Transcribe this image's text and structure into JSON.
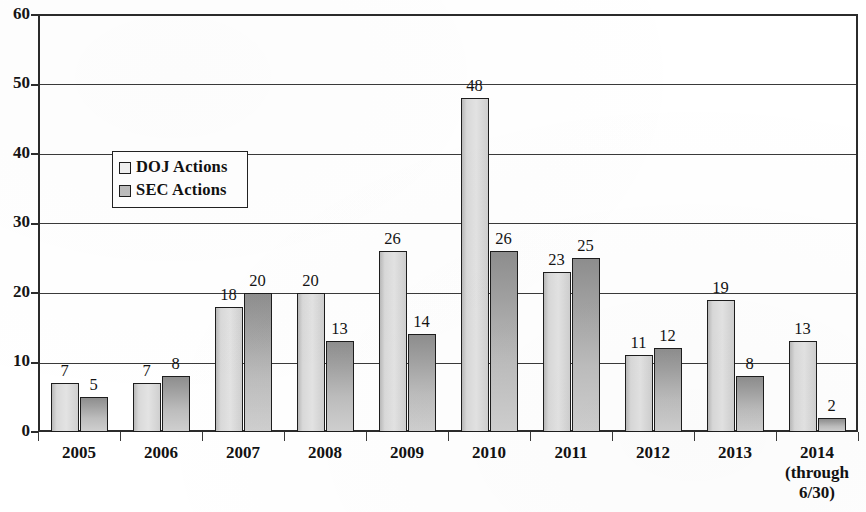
{
  "chart_data": {
    "type": "bar",
    "title": "",
    "subtitle": "",
    "xlabel": "",
    "ylabel": "",
    "ylim": [
      0,
      60
    ],
    "yticks": [
      0,
      10,
      20,
      30,
      40,
      50,
      60
    ],
    "ytick_labels": [
      "0",
      "10",
      "20",
      "30",
      "40",
      "50",
      "60"
    ],
    "grid": true,
    "grid_axis": "y",
    "legend_position": "upper-left-inside",
    "categories": [
      "2005",
      "2006",
      "2007",
      "2008",
      "2009",
      "2010",
      "2011",
      "2012",
      "2013",
      "2014\n(through\n6/30)"
    ],
    "series": [
      {
        "name": "DOJ Actions",
        "color": "#e0e0e0",
        "values": [
          7,
          7,
          18,
          20,
          26,
          48,
          23,
          11,
          19,
          13
        ]
      },
      {
        "name": "SEC Actions",
        "color": "#a8a8a8",
        "values": [
          5,
          8,
          20,
          13,
          14,
          26,
          25,
          12,
          8,
          2
        ]
      }
    ],
    "data_labels": {
      "DOJ Actions": [
        "7",
        "7",
        "18",
        "20",
        "26",
        "48",
        "23",
        "11",
        "19",
        "13"
      ],
      "SEC Actions": [
        "5",
        "8",
        "20",
        "13",
        "14",
        "26",
        "25",
        "12",
        "8",
        "2"
      ]
    }
  },
  "legend": {
    "items": [
      {
        "label": "DOJ Actions",
        "swatch": "doj"
      },
      {
        "label": "SEC Actions",
        "swatch": "sec"
      }
    ]
  },
  "colors": {
    "axis": "#2b2b2b",
    "gridline": "#3a3a3a",
    "text": "#121212",
    "background": "#ffffff",
    "doj_bar": "#e0e0e0",
    "sec_bar": "#a8a8a8"
  }
}
